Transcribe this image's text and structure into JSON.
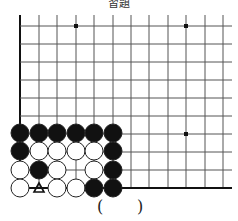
{
  "title": "習題",
  "board": {
    "grid_x": [
      20,
      39,
      57,
      76,
      94,
      113,
      131,
      149,
      168,
      186,
      205,
      223
    ],
    "grid_y": [
      26,
      44,
      62,
      80,
      98,
      116,
      134,
      152,
      170,
      188
    ],
    "right_edge": 232,
    "top_edge": 15,
    "line_color": "#555555",
    "edge_color": "#111111",
    "star_points": [
      [
        76,
        26
      ],
      [
        186,
        26
      ],
      [
        186,
        134
      ]
    ],
    "stones": [
      {
        "x": 20,
        "y": 133,
        "color": "black"
      },
      {
        "x": 39,
        "y": 133,
        "color": "black"
      },
      {
        "x": 57,
        "y": 133,
        "color": "black"
      },
      {
        "x": 76,
        "y": 133,
        "color": "black"
      },
      {
        "x": 94,
        "y": 133,
        "color": "black"
      },
      {
        "x": 113,
        "y": 133,
        "color": "black"
      },
      {
        "x": 20,
        "y": 151,
        "color": "black"
      },
      {
        "x": 39,
        "y": 151,
        "color": "white"
      },
      {
        "x": 57,
        "y": 151,
        "color": "white"
      },
      {
        "x": 76,
        "y": 151,
        "color": "white"
      },
      {
        "x": 94,
        "y": 151,
        "color": "white"
      },
      {
        "x": 113,
        "y": 151,
        "color": "black"
      },
      {
        "x": 20,
        "y": 170,
        "color": "white"
      },
      {
        "x": 39,
        "y": 170,
        "color": "black"
      },
      {
        "x": 57,
        "y": 170,
        "color": "white"
      },
      {
        "x": 94,
        "y": 170,
        "color": "white"
      },
      {
        "x": 113,
        "y": 170,
        "color": "black"
      },
      {
        "x": 20,
        "y": 188,
        "color": "white"
      },
      {
        "x": 57,
        "y": 188,
        "color": "white"
      },
      {
        "x": 76,
        "y": 188,
        "color": "white"
      },
      {
        "x": 94,
        "y": 188,
        "color": "black"
      },
      {
        "x": 113,
        "y": 188,
        "color": "black"
      }
    ],
    "markers": [
      {
        "x": 39,
        "y": 188,
        "symbol": "triangle"
      }
    ]
  },
  "answer": {
    "open": "(",
    "close": ")"
  }
}
